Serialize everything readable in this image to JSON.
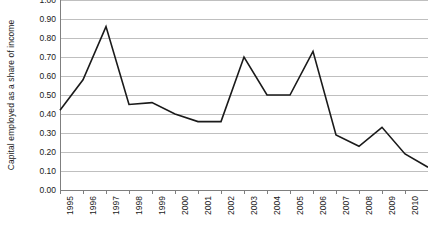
{
  "chart_data": {
    "type": "line",
    "title": "",
    "subtitle": "",
    "xlabel": "",
    "ylabel": "Capital employed as a share of income",
    "categories": [
      "1995",
      "1996",
      "1997",
      "1998",
      "1999",
      "2000",
      "2001",
      "2002",
      "2003",
      "2004",
      "2005",
      "2006",
      "2007",
      "2008",
      "2009",
      "2010",
      "2011"
    ],
    "values": [
      0.42,
      0.58,
      0.86,
      0.45,
      0.46,
      0.4,
      0.36,
      0.36,
      0.7,
      0.5,
      0.5,
      0.73,
      0.29,
      0.23,
      0.33,
      0.19,
      0.12
    ],
    "series": [
      {
        "name": "Capital employed as a share of income",
        "values": [
          0.42,
          0.58,
          0.86,
          0.45,
          0.46,
          0.4,
          0.36,
          0.36,
          0.7,
          0.5,
          0.5,
          0.73,
          0.29,
          0.23,
          0.33,
          0.19,
          0.12
        ]
      }
    ],
    "ylim": [
      0.0,
      1.0
    ],
    "ytick_step": 0.1,
    "ytick_labels": [
      "1.00",
      "0.90",
      "0.80",
      "0.70",
      "0.60",
      "0.50",
      "0.40",
      "0.30",
      "0.20",
      "0.10",
      "0.00"
    ],
    "ytick_values": [
      1.0,
      0.9,
      0.8,
      0.7,
      0.6,
      0.5,
      0.4,
      0.3,
      0.2,
      0.1,
      0.0
    ],
    "grid": true,
    "grid_axis": "y",
    "legend": false,
    "legend_position": "none",
    "line_color": "#1a1a1a",
    "grid_color": "#bfbfbf",
    "axis_color": "#7f7f7f",
    "background_color": "#ffffff",
    "markers": false,
    "xtick_label_rotation": -90
  }
}
